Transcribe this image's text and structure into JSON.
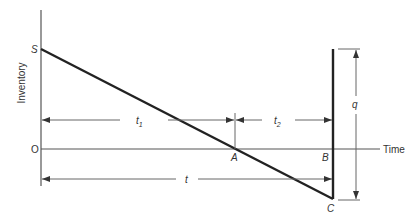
{
  "diagram": {
    "axis_labels": {
      "y": "Inventory",
      "x": "Time",
      "origin": "O"
    },
    "points": {
      "S": "S",
      "A": "A",
      "B": "B",
      "C": "C"
    },
    "dimensions": {
      "t1": "t",
      "t1_sub": "1",
      "t2": "t",
      "t2_sub": "2",
      "t": "t",
      "q": "q"
    },
    "colors": {
      "line": "#222222",
      "thin": "#555555"
    }
  }
}
